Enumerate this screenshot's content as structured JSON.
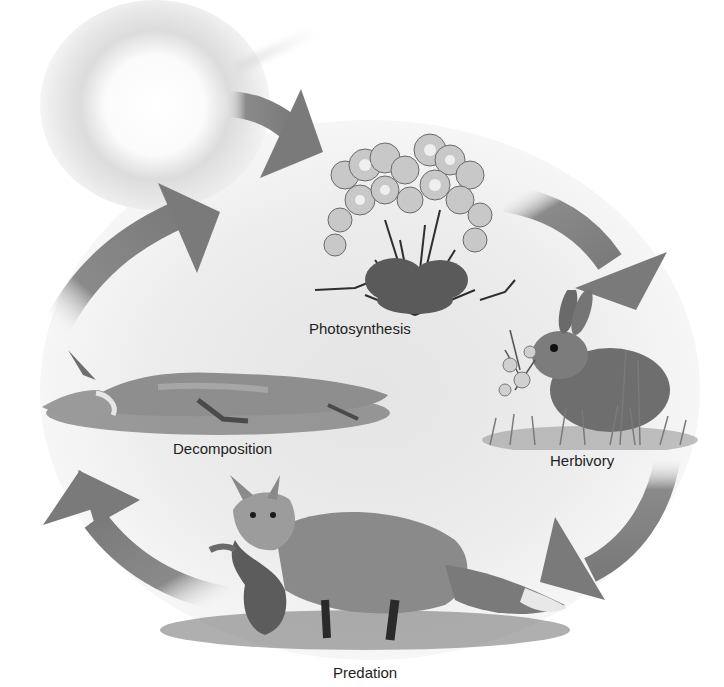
{
  "diagram": {
    "type": "cycle",
    "stages": [
      {
        "id": "sun",
        "label": "",
        "icon": "sun-icon"
      },
      {
        "id": "photosynthesis",
        "label": "Photosynthesis",
        "icon": "plant-icon"
      },
      {
        "id": "herbivory",
        "label": "Herbivory",
        "icon": "rabbit-icon"
      },
      {
        "id": "predation",
        "label": "Predation",
        "icon": "fox-with-prey-icon"
      },
      {
        "id": "decomposition",
        "label": "Decomposition",
        "icon": "dead-fox-icon"
      }
    ],
    "flow": [
      {
        "from": "sun",
        "to": "photosynthesis"
      },
      {
        "from": "photosynthesis",
        "to": "herbivory"
      },
      {
        "from": "herbivory",
        "to": "predation"
      },
      {
        "from": "predation",
        "to": "decomposition"
      },
      {
        "from": "decomposition",
        "to": "sun"
      }
    ],
    "colors": {
      "arrow": "#7a7a7a",
      "arrow_fade": "#ffffff",
      "label_text": "#1e1e1e",
      "backdrop": "#e8e8e8"
    }
  },
  "labels": {
    "photosynthesis": "Photosynthesis",
    "herbivory": "Herbivory",
    "predation": "Predation",
    "decomposition": "Decomposition"
  }
}
